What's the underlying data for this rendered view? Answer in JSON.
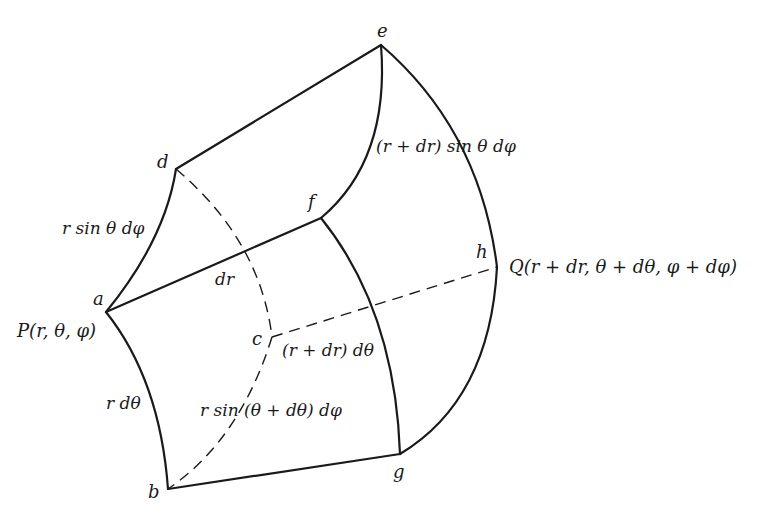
{
  "figure": {
    "stroke_color": "#1a1a1a",
    "background": "#ffffff"
  },
  "vertices": {
    "a": {
      "label": "a",
      "x": 106,
      "y": 312
    },
    "b": {
      "label": "b",
      "x": 168,
      "y": 489
    },
    "c": {
      "label": "c",
      "x": 272,
      "y": 337
    },
    "d": {
      "label": "d",
      "x": 176,
      "y": 169
    },
    "e": {
      "label": "e",
      "x": 381,
      "y": 45
    },
    "f": {
      "label": "f",
      "x": 321,
      "y": 218
    },
    "g": {
      "label": "g",
      "x": 400,
      "y": 454
    },
    "h": {
      "label": "h",
      "x": 497,
      "y": 267
    }
  },
  "labels": {
    "point_p": "P(r, θ, φ)",
    "point_q": "Q(r + dr, θ + dθ, φ + dφ)",
    "edge_ad": "r sin θ dφ",
    "edge_ab": "r dθ",
    "edge_af": "dr",
    "edge_fe": "(r + dr) sin θ dφ",
    "edge_fg": "(r + dr) dθ",
    "edge_bc": "r sin (θ + dθ)  dφ"
  }
}
